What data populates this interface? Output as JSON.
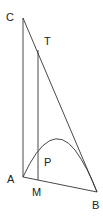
{
  "diagram": {
    "type": "geometry",
    "colors": {
      "line": "#333333",
      "label": "#222222",
      "background": "#ffffff"
    },
    "points": {
      "C": {
        "label": "C",
        "x": 23,
        "y": 18,
        "lx": 6,
        "ly": 21
      },
      "T": {
        "label": "T",
        "x": 38,
        "y": 50,
        "lx": 44,
        "ly": 45
      },
      "A": {
        "label": "A",
        "x": 23,
        "y": 177,
        "lx": 7,
        "ly": 183
      },
      "M": {
        "label": "M",
        "x": 38,
        "y": 180,
        "lx": 32,
        "ly": 196
      },
      "B": {
        "label": "B",
        "x": 97,
        "y": 192,
        "lx": 92,
        "ly": 209
      },
      "P": {
        "label": "P",
        "x": 47,
        "y": 158,
        "lx": 44,
        "ly": 166
      }
    },
    "segments": [
      {
        "name": "segment-CA",
        "from": "C",
        "to": "A"
      },
      {
        "name": "segment-CB",
        "from": "C",
        "to": "B"
      },
      {
        "name": "segment-AB",
        "from": "A",
        "to": "B"
      },
      {
        "name": "segment-TM",
        "from": "T",
        "to": "M"
      }
    ],
    "curves": [
      {
        "name": "parabola-arc-AB",
        "from": "A",
        "to": "B",
        "apex": [
          58,
          144
        ]
      }
    ]
  }
}
